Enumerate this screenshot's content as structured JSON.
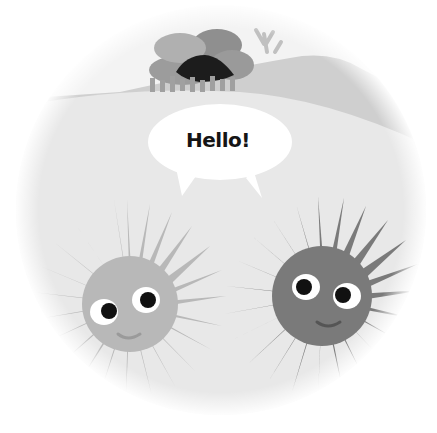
{
  "illustration": {
    "description": "Two cartoon sea urchins under a speech bubble, framed in a soft circular vignette",
    "speech_bubble": {
      "text": "Hello!"
    },
    "characters": [
      {
        "name": "left-urchin",
        "shade": "light-gray",
        "color": "#b8b8b8"
      },
      {
        "name": "right-urchin",
        "shade": "dark-gray",
        "color": "#7a7a7a"
      }
    ],
    "background": {
      "cave_color": "#1c1c1c",
      "rock_colors": [
        "#9a9a9a",
        "#a8a8a8",
        "#8c8c8c"
      ],
      "hill_color": "#c8c8c8",
      "ground_color": "#e6e6e6",
      "frame_color": "#ffffff"
    }
  }
}
